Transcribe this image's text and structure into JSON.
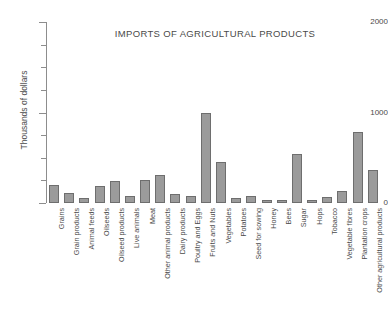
{
  "chart_data": {
    "type": "bar",
    "title": "IMPORTS OF AGRICULTURAL PRODUCTS",
    "xlabel": "",
    "ylabel": "Thousands of dollars",
    "ylim": [
      0,
      2000
    ],
    "ytick_labels": [
      "0",
      "1000",
      "2000"
    ],
    "ytick_values": [
      0,
      1000,
      2000
    ],
    "minor_ticks": [
      250,
      500,
      750,
      1250,
      1500,
      1750
    ],
    "grid": false,
    "legend": null,
    "bar_color": "#9b9b9b",
    "bar_edge_color": "#6e6e6e",
    "axis_color": "#8d8d8d",
    "background": "#ffffff",
    "categories": [
      "Grains",
      "Grain products",
      "Animal feeds",
      "Oilseeds",
      "Oilseed products",
      "Live animals",
      "Meat",
      "Other animal products",
      "Dairy products",
      "Poultry and Eggs",
      "Fruits and Nuts",
      "Vegetables",
      "Potatoes",
      "Seed for sowing",
      "Honey",
      "Bees",
      "Sugar",
      "Hops",
      "Tobacco",
      "Vegetable fibres",
      "Plantation crops",
      "Other agricultural products"
    ],
    "values": [
      200,
      110,
      60,
      190,
      240,
      80,
      250,
      310,
      95,
      75,
      1000,
      450,
      55,
      75,
      30,
      30,
      540,
      30,
      65,
      130,
      780,
      370
    ]
  }
}
